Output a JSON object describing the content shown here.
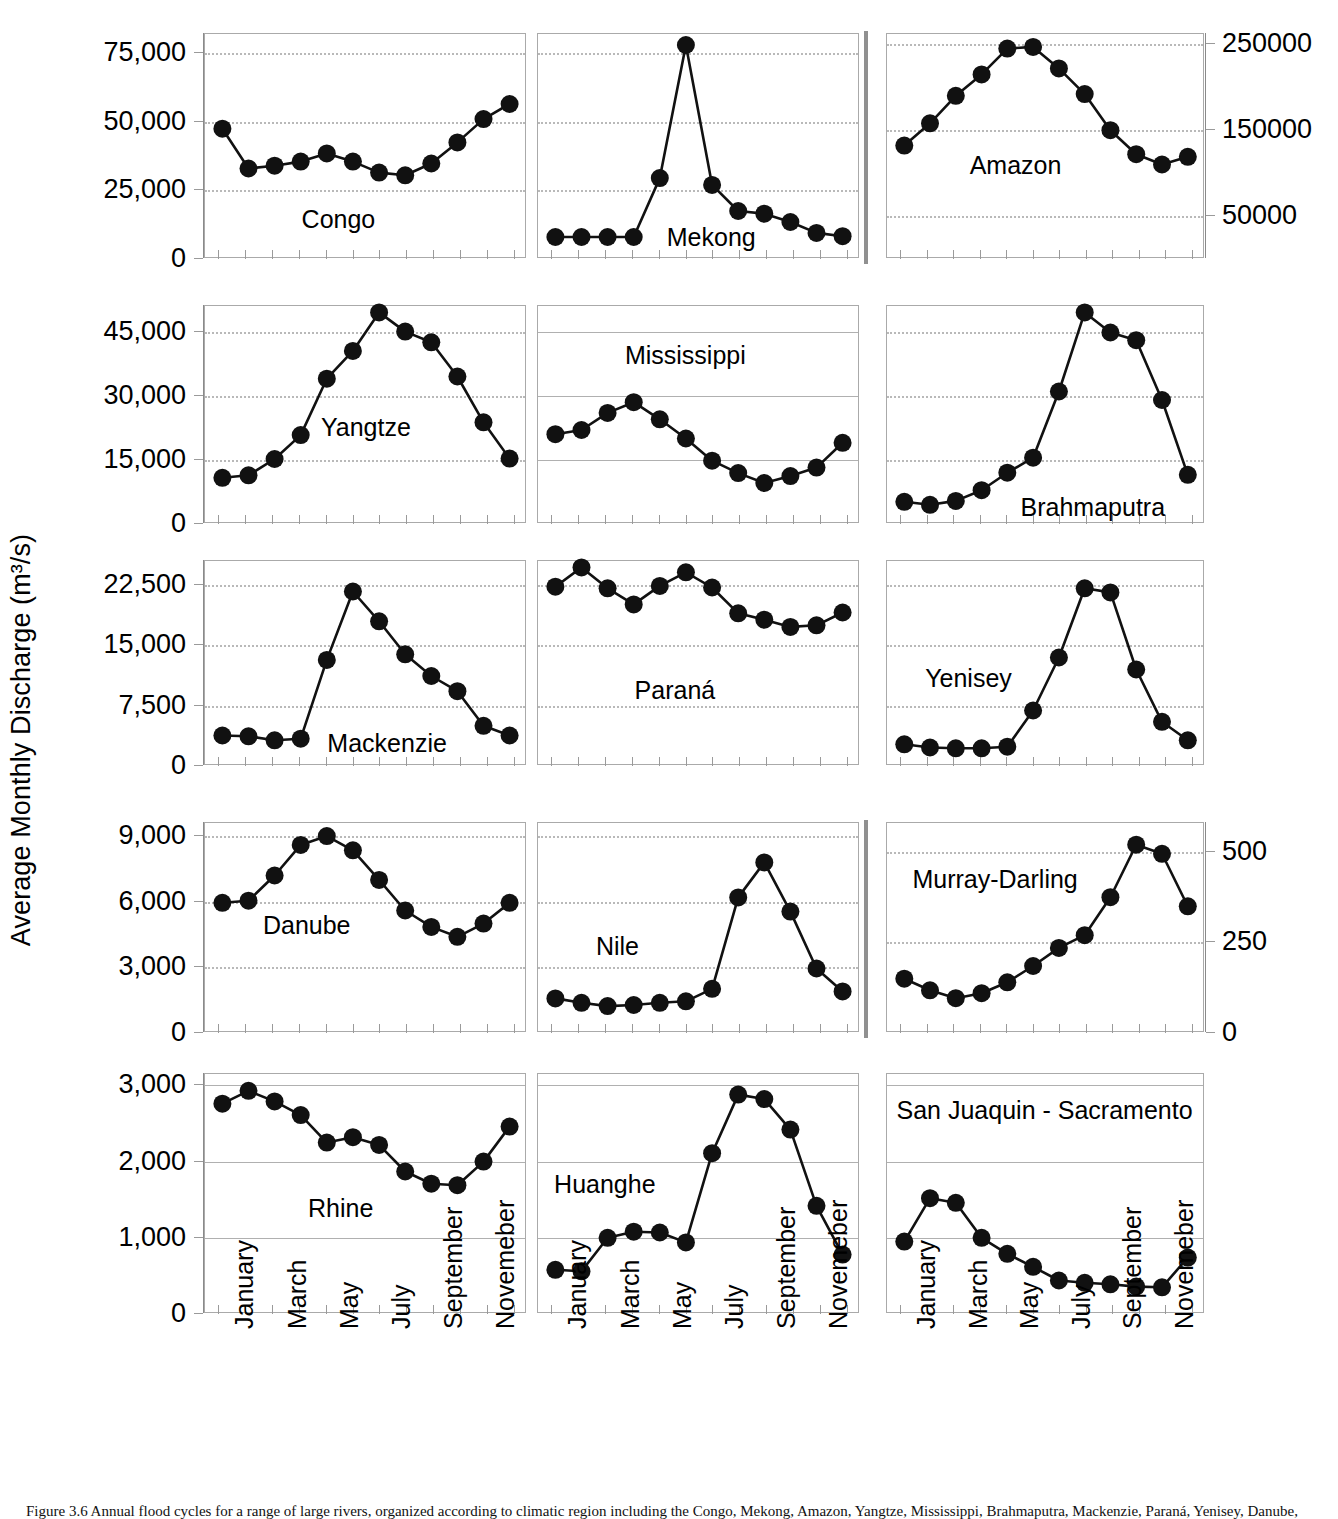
{
  "figure": {
    "ylabel": "Average Monthly Discharge (m³/s)",
    "caption": "Figure 3.6  Annual flood cycles for a range of large rivers, organized according to climatic region including the Congo, Mekong, Amazon, Yangtze, Mississippi, Brahmaputra, Mackenzie, Paraná, Yenisey, Danube, Nile, Murray-Darling, Rhine, Huanghe and San Juaquin - Sacramento."
  },
  "xaxis": {
    "tick_labels": [
      "January",
      "March",
      "May",
      "July",
      "September",
      "Novemeber"
    ],
    "months": [
      "January",
      "February",
      "March",
      "April",
      "May",
      "June",
      "July",
      "August",
      "September",
      "October",
      "November",
      "December"
    ]
  },
  "chart_data": [
    {
      "type": "line",
      "title": "Congo",
      "panel": "r1c1",
      "axis_side": "left",
      "xlabel": "",
      "ylabel": "Average Monthly Discharge (m³/s)",
      "ylim": [
        0,
        82000
      ],
      "yticks": [
        0,
        25000,
        50000,
        75000
      ],
      "ytick_labels": [
        "0",
        "25,000",
        "50,000",
        "75,000"
      ],
      "grid": true,
      "categories": [
        "January",
        "February",
        "March",
        "April",
        "May",
        "June",
        "July",
        "August",
        "September",
        "October",
        "November",
        "December"
      ],
      "values": [
        47500,
        33000,
        34000,
        35500,
        38500,
        35500,
        31500,
        30500,
        34800,
        42500,
        51000,
        56500
      ]
    },
    {
      "type": "line",
      "title": "Mekong",
      "panel": "r1c2",
      "axis_side": "none",
      "xlabel": "",
      "ylim": [
        0,
        82000
      ],
      "yticks": [
        0,
        25000,
        50000,
        75000
      ],
      "grid": true,
      "categories": [
        "January",
        "February",
        "March",
        "April",
        "May",
        "June",
        "July",
        "August",
        "September",
        "October",
        "November",
        "December"
      ],
      "values": [
        8000,
        8000,
        8000,
        8000,
        29500,
        78000,
        27000,
        17500,
        16500,
        13500,
        9500,
        8300
      ]
    },
    {
      "type": "line",
      "title": "Amazon",
      "panel": "r1c3",
      "axis_side": "right",
      "xlabel": "",
      "ylim": [
        0,
        262000
      ],
      "yticks": [
        50000,
        150000,
        250000
      ],
      "ytick_labels": [
        "50000",
        "150000",
        "250000"
      ],
      "grid": true,
      "categories": [
        "January",
        "February",
        "March",
        "April",
        "May",
        "June",
        "July",
        "August",
        "September",
        "October",
        "November",
        "December"
      ],
      "values": [
        132000,
        158000,
        190000,
        215000,
        245000,
        247000,
        222000,
        192000,
        150000,
        122000,
        110000,
        119000
      ]
    },
    {
      "type": "line",
      "title": "Yangtze",
      "panel": "r2c1",
      "axis_side": "left",
      "xlabel": "",
      "ylim": [
        0,
        51000
      ],
      "yticks": [
        0,
        15000,
        30000,
        45000
      ],
      "ytick_labels": [
        "0",
        "15,000",
        "30,000",
        "45,000"
      ],
      "grid": true,
      "categories": [
        "January",
        "February",
        "March",
        "April",
        "May",
        "June",
        "July",
        "August",
        "September",
        "October",
        "November",
        "December"
      ],
      "values": [
        10800,
        11400,
        15200,
        20800,
        34000,
        40500,
        49500,
        45000,
        42500,
        34500,
        23800,
        15300
      ]
    },
    {
      "type": "line",
      "title": "Mississippi",
      "panel": "r2c2",
      "axis_side": "none",
      "xlabel": "",
      "ylim": [
        0,
        51000
      ],
      "yticks": [
        0,
        15000,
        30000,
        45000
      ],
      "grid": true,
      "categories": [
        "January",
        "February",
        "March",
        "April",
        "May",
        "June",
        "July",
        "August",
        "September",
        "October",
        "November",
        "December"
      ],
      "values": [
        21000,
        22000,
        26000,
        28500,
        24500,
        20000,
        14800,
        11900,
        9600,
        11200,
        13200,
        19000
      ]
    },
    {
      "type": "line",
      "title": "Brahmaputra",
      "panel": "r2c3",
      "axis_side": "none",
      "xlabel": "",
      "ylim": [
        0,
        51000
      ],
      "yticks": [
        0,
        15000,
        30000,
        45000
      ],
      "grid": true,
      "categories": [
        "January",
        "February",
        "March",
        "April",
        "May",
        "June",
        "July",
        "August",
        "September",
        "October",
        "November",
        "December"
      ],
      "values": [
        5200,
        4500,
        5400,
        7900,
        12000,
        15500,
        31000,
        49500,
        44800,
        43000,
        29000,
        11500
      ]
    },
    {
      "type": "line",
      "title": "Mackenzie",
      "panel": "r3c1",
      "axis_side": "left",
      "xlabel": "",
      "ylim": [
        0,
        25500
      ],
      "yticks": [
        0,
        7500,
        15000,
        22500
      ],
      "ytick_labels": [
        "0",
        "7,500",
        "15,000",
        "22,500"
      ],
      "grid": true,
      "categories": [
        "January",
        "February",
        "March",
        "April",
        "May",
        "June",
        "July",
        "August",
        "September",
        "October",
        "November",
        "December"
      ],
      "values": [
        3800,
        3700,
        3200,
        3400,
        13200,
        21700,
        18000,
        13900,
        11200,
        9300,
        5000,
        3800
      ]
    },
    {
      "type": "line",
      "title": "Paraná",
      "panel": "r3c2",
      "axis_side": "none",
      "xlabel": "",
      "ylim": [
        0,
        25500
      ],
      "yticks": [
        0,
        7500,
        15000,
        22500
      ],
      "grid": true,
      "categories": [
        "January",
        "February",
        "March",
        "April",
        "May",
        "June",
        "July",
        "August",
        "September",
        "October",
        "November",
        "December"
      ],
      "values": [
        22300,
        24700,
        22100,
        20100,
        22400,
        24100,
        22200,
        19000,
        18200,
        17300,
        17500,
        19100
      ]
    },
    {
      "type": "line",
      "title": "Yenisey",
      "panel": "r3c3",
      "axis_side": "none",
      "xlabel": "",
      "ylim": [
        0,
        25500
      ],
      "yticks": [
        0,
        7500,
        15000,
        22500
      ],
      "grid": true,
      "categories": [
        "January",
        "February",
        "March",
        "April",
        "May",
        "June",
        "July",
        "August",
        "September",
        "October",
        "November",
        "December"
      ],
      "values": [
        2700,
        2300,
        2200,
        2200,
        2400,
        6900,
        13500,
        22100,
        21600,
        12000,
        5500,
        3200
      ]
    },
    {
      "type": "line",
      "title": "Danube",
      "panel": "r4c1",
      "axis_side": "left",
      "xlabel": "",
      "ylim": [
        0,
        9600
      ],
      "yticks": [
        0,
        3000,
        6000,
        9000
      ],
      "ytick_labels": [
        "0",
        "3,000",
        "6,000",
        "9,000"
      ],
      "grid": true,
      "categories": [
        "January",
        "February",
        "March",
        "April",
        "May",
        "June",
        "July",
        "August",
        "September",
        "October",
        "November",
        "December"
      ],
      "values": [
        5950,
        6050,
        7200,
        8600,
        9000,
        8350,
        7000,
        5600,
        4850,
        4400,
        5000,
        5950
      ]
    },
    {
      "type": "line",
      "title": "Nile",
      "panel": "r4c2",
      "axis_side": "none",
      "xlabel": "",
      "ylim": [
        0,
        9600
      ],
      "yticks": [
        0,
        3000,
        6000,
        9000
      ],
      "grid": true,
      "categories": [
        "January",
        "February",
        "March",
        "April",
        "May",
        "June",
        "July",
        "August",
        "September",
        "October",
        "November",
        "December"
      ],
      "values": [
        1580,
        1380,
        1230,
        1280,
        1380,
        1450,
        2020,
        6200,
        7800,
        5550,
        2950,
        1900
      ]
    },
    {
      "type": "line",
      "title": "Murray-Darling",
      "panel": "r4c3",
      "axis_side": "right",
      "xlabel": "",
      "ylim": [
        0,
        580
      ],
      "yticks": [
        0,
        250,
        500
      ],
      "ytick_labels": [
        "0",
        "250",
        "500"
      ],
      "grid": true,
      "categories": [
        "January",
        "February",
        "March",
        "April",
        "May",
        "June",
        "July",
        "August",
        "September",
        "October",
        "November",
        "December"
      ],
      "values": [
        150,
        118,
        96,
        110,
        140,
        185,
        235,
        270,
        375,
        520,
        495,
        350
      ]
    },
    {
      "type": "line",
      "title": "Rhine",
      "panel": "r5c1",
      "axis_side": "left",
      "xlabel": "",
      "ylim": [
        0,
        3150
      ],
      "yticks": [
        0,
        1000,
        2000,
        3000
      ],
      "ytick_labels": [
        "0",
        "1,000",
        "2,000",
        "3,000"
      ],
      "grid": true,
      "categories": [
        "January",
        "February",
        "March",
        "April",
        "May",
        "June",
        "July",
        "August",
        "September",
        "October",
        "November",
        "December"
      ],
      "values": [
        2760,
        2930,
        2790,
        2610,
        2250,
        2320,
        2220,
        1870,
        1710,
        1690,
        2000,
        2460
      ]
    },
    {
      "type": "line",
      "title": "Huanghe",
      "panel": "r5c2",
      "axis_side": "none",
      "xlabel": "",
      "ylim": [
        0,
        3150
      ],
      "yticks": [
        0,
        1000,
        2000,
        3000
      ],
      "grid": true,
      "categories": [
        "January",
        "February",
        "March",
        "April",
        "May",
        "June",
        "July",
        "August",
        "September",
        "October",
        "November",
        "December"
      ],
      "values": [
        580,
        560,
        1000,
        1080,
        1070,
        940,
        2110,
        2880,
        2820,
        2420,
        1420,
        780
      ]
    },
    {
      "type": "line",
      "title": "San Juaquin - Sacramento",
      "panel": "r5c3",
      "axis_side": "none",
      "xlabel": "",
      "ylim": [
        0,
        3150
      ],
      "yticks": [
        0,
        1000,
        2000,
        3000
      ],
      "grid": true,
      "categories": [
        "January",
        "February",
        "March",
        "April",
        "May",
        "June",
        "July",
        "August",
        "September",
        "October",
        "November",
        "December"
      ],
      "values": [
        950,
        1520,
        1460,
        1000,
        790,
        620,
        440,
        410,
        390,
        360,
        350,
        740
      ]
    }
  ]
}
